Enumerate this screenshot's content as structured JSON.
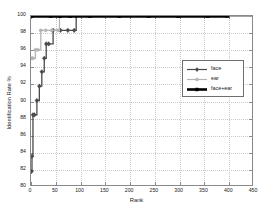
{
  "chart_data": {
    "type": "line",
    "title": "",
    "xlabel": "Rank",
    "ylabel": "Identification Rate %",
    "xlim": [
      0,
      450
    ],
    "ylim": [
      80,
      100
    ],
    "xticks": [
      0,
      50,
      100,
      150,
      200,
      250,
      300,
      350,
      400,
      450
    ],
    "yticks": [
      80,
      82,
      84,
      86,
      88,
      90,
      92,
      94,
      96,
      98,
      100
    ],
    "grid": true,
    "legend_position": "center-right",
    "series": [
      {
        "name": "face",
        "color": "#4a4a4a",
        "marker": "diamond",
        "x": [
          1,
          2,
          4,
          7,
          12,
          17,
          22,
          27,
          31,
          36,
          45,
          60,
          75,
          88,
          92,
          450
        ],
        "y": [
          81.6,
          83.4,
          88.3,
          88.3,
          90.0,
          91.7,
          93.4,
          95.0,
          96.7,
          96.7,
          98.3,
          98.3,
          98.3,
          98.3,
          100.0,
          100.0
        ]
      },
      {
        "name": "ear",
        "color": "#b4b4b4",
        "marker": "circle",
        "x": [
          1,
          4,
          9,
          14,
          20,
          30,
          42,
          55,
          58,
          450
        ],
        "y": [
          95.0,
          95.0,
          96.0,
          96.0,
          98.3,
          98.3,
          98.3,
          98.3,
          100.0,
          100.0
        ]
      },
      {
        "name": "face+ear",
        "color": "#000000",
        "marker": "square",
        "x": [
          1,
          40,
          60,
          80,
          120,
          180,
          240,
          300,
          360,
          400
        ],
        "y": [
          100.0,
          100.0,
          100.0,
          100.0,
          100.0,
          100.0,
          100.0,
          100.0,
          100.0,
          100.0
        ]
      }
    ],
    "annotations": []
  },
  "axes": {
    "xtick_labels": [
      "0",
      "50",
      "100",
      "150",
      "200",
      "250",
      "300",
      "350",
      "400",
      "450"
    ],
    "ytick_labels": [
      "80",
      "82",
      "84",
      "86",
      "88",
      "90",
      "92",
      "94",
      "96",
      "98",
      "100"
    ],
    "xlabel": "Rank",
    "ylabel": "Identification Rate %"
  },
  "legend": {
    "entries": [
      {
        "label": "face",
        "color": "#4a4a4a",
        "marker": "diamond"
      },
      {
        "label": "ear",
        "color": "#b4b4b4",
        "marker": "circle"
      },
      {
        "label": "face+ear",
        "color": "#000000",
        "marker": "square"
      }
    ]
  },
  "colors": {
    "face": "#4a4a4a",
    "ear": "#b4b4b4",
    "face_ear": "#000000",
    "grid": "#c9c9c9",
    "frame": "#8a8a8a",
    "background": "#ffffff"
  }
}
